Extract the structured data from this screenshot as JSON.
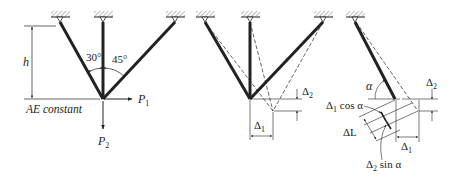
{
  "figure_a": {
    "height_label": "h",
    "angle_left": "30°",
    "angle_right": "45°",
    "note": "AE constant",
    "load_horizontal": "P",
    "load_horizontal_sub": "1",
    "load_vertical": "P",
    "load_vertical_sub": "2"
  },
  "figure_b": {
    "delta_horizontal": "Δ",
    "delta_horizontal_sub": "1",
    "delta_vertical": "Δ",
    "delta_vertical_sub": "2"
  },
  "figure_c": {
    "angle": "α",
    "delta_vertical": "Δ",
    "delta_vertical_sub": "2",
    "cos_term_delta": "Δ",
    "cos_term_sub": "1",
    "cos_term_text": " cos α",
    "elongation": "ΔL",
    "delta_horizontal": "Δ",
    "delta_horizontal_sub": "1",
    "sin_term_delta": "Δ",
    "sin_term_sub": "2",
    "sin_term_text": " sin α"
  },
  "colors": {
    "ink": "#222222",
    "hatch": "#777777",
    "background": "#ffffff"
  }
}
